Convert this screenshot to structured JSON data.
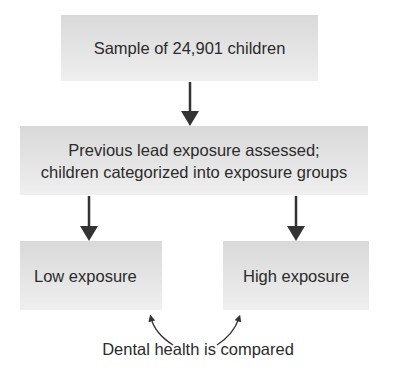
{
  "diagram": {
    "nodes": [
      {
        "id": "sample",
        "label": "Sample of 24,901 children"
      },
      {
        "id": "assessment",
        "line1": "Previous lead exposure assessed;",
        "line2": "children categorized into exposure groups"
      },
      {
        "id": "low",
        "label": "Low exposure"
      },
      {
        "id": "high",
        "label": "High exposure"
      }
    ],
    "edges": [
      {
        "from": "sample",
        "to": "assessment"
      },
      {
        "from": "assessment",
        "to": "low"
      },
      {
        "from": "assessment",
        "to": "high"
      }
    ],
    "comparison_label": "Dental health is compared",
    "colors": {
      "box_fill": "#e2e2e2",
      "arrow": "#333333",
      "text": "#2b2b2b"
    }
  }
}
